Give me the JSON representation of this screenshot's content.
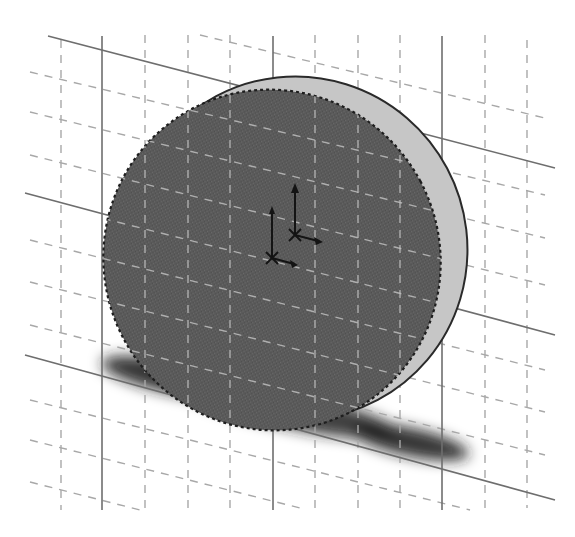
{
  "viewport": {
    "type": "cad-3d-graphics-area",
    "background": "#ffffff"
  },
  "model": {
    "feature": "extruded-disc",
    "face_color": "#5c5c5c",
    "rim_color": "#c4c4c4",
    "edge_color": "#2a2a2a",
    "shadow_color": "#222222"
  },
  "grid": {
    "major_line_color": "#6e6e6e",
    "minor_line_color": "#a8a8a8",
    "major_vertical_x": [
      102,
      273,
      442
    ],
    "minor_vertical_x": [
      61,
      145,
      188,
      230,
      315,
      358,
      400,
      485,
      527
    ]
  },
  "triads": [
    {
      "name": "origin-triad-front",
      "x": 295,
      "y": 235
    },
    {
      "name": "origin-triad-back",
      "x": 272,
      "y": 258
    }
  ]
}
